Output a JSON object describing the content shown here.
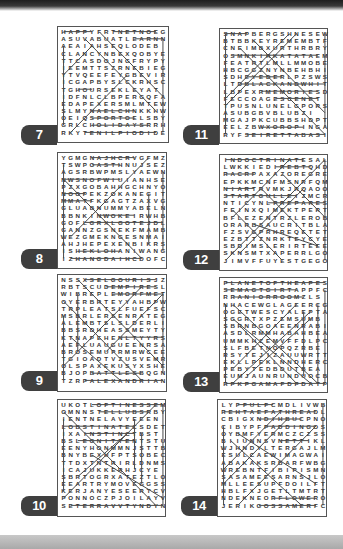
{
  "page": {
    "background": "#ffffff",
    "badge_color": "#3f3f3f",
    "strike_color": "#4a4a4a"
  },
  "puzzles": [
    {
      "number": "7",
      "position": "left-1",
      "grid": [
        "HAPPYFRTNETNOEG",
        "ASUVABUATLEARNN",
        "AEAIAHSEQLODEB",
        "CLANCYNBEXQOBYE",
        "TTCASDOJNGFRYPY",
        "IEEMTTSZRNEBIEG",
        "YTVQEEFEYGBEVIR",
        "ICGAPBYSLCKRHSC",
        "TGHOURSEKLEYAT",
        "IDFNLCLBPERGQFA",
        "EDAPEXERSMLMTEW",
        "SLMYNAELCHNKKHW",
        "OEIQSPORTOELSBY",
        "GRLCHOLIDAYSRRH",
        "RKYTENILPIODIDEF"
      ]
    },
    {
      "number": "11",
      "position": "right-1",
      "grid": [
        "SNAPBERGSHNESEW",
        "BTBBKEYREMEMBTF",
        "CNEIMBXURTHRBRY",
        "OSMNKIRKATATAEM",
        "FEATRTLMLLMMOBE",
        "HBCGGZNYNBEHBHI",
        "SDHEYEDERLPZSWS",
        "LTDBLACKANDWHITE",
        "LBPEXRMEMORIESD",
        "FECCOAGESCENET",
        "TPUSNLUNELGPORS",
        "ASUBGBVBLUBZI",
        "MGAJPKCUBBSHDPT",
        "EELZBWXOROPINGA",
        "RYFSEIRETTABASI"
      ]
    },
    {
      "number": "8",
      "position": "left-2",
      "grid": [
        "YGMGNAJHCRVGFMZ",
        "TSWPOASTHNUJSEZ",
        "AGSRBWPMSLYAEWN",
        "NWSNOFWIUIANHSE",
        "PZXGOBAHHGCHNYO",
        "NOOPEKZOKANEGIT",
        "MMATFKGAGTZAXVG",
        "GLUABNUMMYABELN",
        "BBNKINWOKEIRWHB",
        "GOFLGRXLGOTEJDL",
        "GANNZGSNEKFMAMB",
        "WEZGMEKNGESNMAI",
        "AHJHEPEXENBIKRS",
        "ISHEKLOHANIWANG",
        "IZHANGDAIHCDOFC"
      ]
    },
    {
      "number": "12",
      "position": "right-2",
      "grid": [
        "INDOCTRINATESAL",
        "LWKKIEDIREBTQHD",
        "RACRPAXAZOREGRE",
        "EPKKMCNFMSNRFQM",
        "NIARTRVMKJRQAOO",
        "STARTGULLEIZMCR",
        "NTICYNLPREPARES",
        "FEINXQIMEKTPERT",
        "BFLEZENTRZLEROB",
        "ORARBSAUCRITBLA",
        "FZSVGPRHREQETET",
        "EZBTTZNRKTEYCYE",
        "SBDIMSLERIRTEEE",
        "SKNSMTXAPERRLGO",
        "JIMVFFUYESTGEGO"
      ]
    },
    {
      "number": "9",
      "position": "left-3",
      "grid": [
        "NSSXSELGOURISJZ",
        "RBTSCUDEMPIRESL",
        "WIBREPLEMORFMET",
        "OYERBRTEYYAHBPW",
        "TRPLEATSLFUEFSC",
        "MSBRLERSENRATEG",
        "ALEMBTSLSLDERLI",
        "BBSRDHEASSMEYTY",
        "KTNAPEHENLTYYRS",
        "AEFLUAUGUEENRSA",
        "BROSEMUPRMRWCEE",
        "TGIOADTVZUSVEMR",
        "OLSPAXEKUSYXSHE",
        "BJOPBATTLESBQGN",
        "TZRPALEXANDRIAN"
      ]
    },
    {
      "number": "13",
      "position": "right-3",
      "grid": [
        "PLANETOFTHEAPES",
        "SEMAGTGIRTAPPFC",
        "RRANIORROOMZLS",
        "NHACEWGLAGEERCG",
        "OGETWESCYALEPTA",
        "SGGRTXPZEMSUMB",
        "SBRNBGOAEENRABI",
        "ASDLRMMHABAHBEA",
        "UMMKHZEMVFFDLPC",
        "SLFBETNOPQZRBE",
        "RSYTEJIZAUUWRTT",
        "EKLLPEKLNNDHERC",
        "PEBYTEDBDUTBEA",
        "EUMJAUNRUNDUOCB",
        "RPKPGAMAFDPDATP"
      ]
    },
    {
      "number": "10",
      "position": "left-4",
      "grid": [
        "UKOTLOFTINESSEM",
        "OMNNSTELLUBSRBY",
        "IENTNELAVYEEEN",
        "LOBSTINATECSDET",
        "IXAINSTINCTBST",
        "BSLEGNITTENTSTU",
        "EENYHONMMNJSTTB",
        "BNYBEXUFPTSOBEC",
        "TTDXTNTRIRLDNMS",
        "ICAJUKKERHJCYE",
        "SBRTOGRXATEZTLO",
        "EEARTRYMOVEGGSS",
        "KERJANYESEERTCV",
        "PONNOCZPJOILAYV",
        "SETERRAVVTYNDYN"
      ]
    },
    {
      "number": "14",
      "position": "right-4",
      "grid": [
        "LYFFULFCMDLIVWB",
        "REHTAEFATHREADL",
        "CBIGXNDIHBUCPNO",
        "CIBYPFPADDINGOS",
        "OYBMFYERMCZCZSS",
        "BIIUNNSVNETTIKLO",
        "WJHNDYLTERGAJLM",
        "ESULCAEWIMAGWAI",
        "ABAKAKSRBARFWBG",
        "WREBNTFIBIPISMN",
        "SASAMEESARNSJLO",
        "MLLEESUPFDOILFT",
        "HBLFXJGETLTMTRT",
        "NDEKNEORFLOWERO",
        "JERIKGOSSAMERFC"
      ]
    }
  ]
}
